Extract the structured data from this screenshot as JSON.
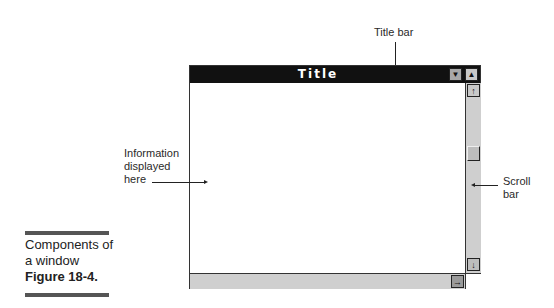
{
  "callouts": {
    "title_bar": "Title bar",
    "scroll_bar_line1": "Scroll",
    "scroll_bar_line2": "bar",
    "info_line1": "Information",
    "info_line2": "displayed",
    "info_line3": "here"
  },
  "window": {
    "title": "Title",
    "minimize_glyph": "▼",
    "maximize_glyph": "▲",
    "scroll_up_glyph": "🡅",
    "scroll_down_glyph": "🡇",
    "scroll_right_glyph": "🡆"
  },
  "caption": {
    "line1": "Components of",
    "line2": "a window",
    "figure": "Figure 18-4."
  },
  "colors": {
    "titlebar": "#111111",
    "scrollbar": "#cfcfcf",
    "button": "#a8a8a8"
  }
}
